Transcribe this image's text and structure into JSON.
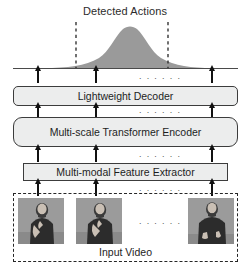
{
  "figure": {
    "type": "architecture-pipeline-diagram",
    "title": "Detected Actions",
    "bottom_label": "Input Video",
    "ellipsis": "· · · · · ·",
    "colors": {
      "box_fill": "#eceded",
      "box_stroke": "#3c3c3c",
      "curve_fill": "#9a9a9a",
      "dashed_stroke": "#262626",
      "arrow": "#111111",
      "frame_bg": "#8e8e8e",
      "text": "#1d1d1d"
    },
    "blocks": [
      {
        "id": "decoder",
        "label": "Lightweight Decoder",
        "shape": "rounded-rect"
      },
      {
        "id": "encoder",
        "label": "Multi-scale Transformer Encoder",
        "shape": "rounded-rect"
      },
      {
        "id": "extractor",
        "label": "Multi-modal Feature Extractor",
        "shape": "rect"
      }
    ],
    "output_plot": {
      "kind": "gaussian-action-score",
      "baseline_y": 68,
      "peak_x": 123,
      "peak_y": 28,
      "boundary_lines_x": [
        76,
        168
      ],
      "boundary_style": "dashed"
    },
    "token_columns_x": [
      38,
      96,
      212
    ],
    "ellipsis_column_x": 160,
    "frames": [
      {
        "id": "frame-1",
        "x": 18
      },
      {
        "id": "frame-2",
        "x": 76
      },
      {
        "id": "frame-3",
        "x": 188
      }
    ],
    "arrow_rows": [
      {
        "id": "extractor-to-encoder"
      },
      {
        "id": "encoder-to-decoder"
      },
      {
        "id": "decoder-to-output"
      },
      {
        "id": "video-to-extractor"
      }
    ]
  }
}
